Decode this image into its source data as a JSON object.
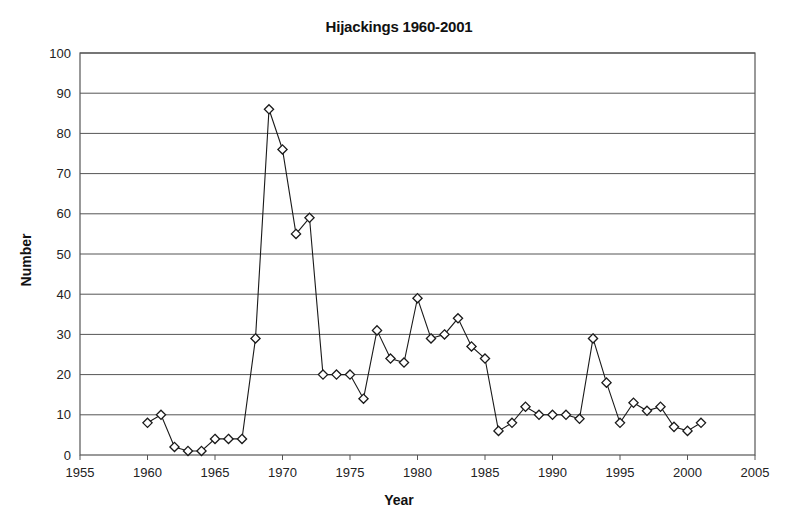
{
  "chart_data": {
    "type": "line",
    "title": "Hijackings 1960-2001",
    "xlabel": "Year",
    "ylabel": "Number",
    "xlim": [
      1955,
      2005
    ],
    "ylim": [
      0,
      100
    ],
    "xticks": [
      1955,
      1960,
      1965,
      1970,
      1975,
      1980,
      1985,
      1990,
      1995,
      2000,
      2005
    ],
    "yticks": [
      0,
      10,
      20,
      30,
      40,
      50,
      60,
      70,
      80,
      90,
      100
    ],
    "grid": "horizontal",
    "legend": null,
    "marker": "open-diamond",
    "line_color": "#1a1a1a",
    "marker_color": "#1a1a1a",
    "marker_fill": "#ffffff",
    "x": [
      1960,
      1961,
      1962,
      1963,
      1964,
      1965,
      1966,
      1967,
      1968,
      1969,
      1970,
      1971,
      1972,
      1973,
      1974,
      1975,
      1976,
      1977,
      1978,
      1979,
      1980,
      1981,
      1982,
      1983,
      1984,
      1985,
      1986,
      1987,
      1988,
      1989,
      1990,
      1991,
      1992,
      1993,
      1994,
      1995,
      1996,
      1997,
      1998,
      1999,
      2000,
      2001
    ],
    "values": [
      8,
      10,
      2,
      1,
      1,
      4,
      4,
      4,
      29,
      86,
      76,
      55,
      59,
      20,
      20,
      20,
      14,
      31,
      24,
      23,
      39,
      29,
      30,
      34,
      27,
      24,
      6,
      8,
      12,
      10,
      10,
      10,
      9,
      29,
      18,
      8,
      13,
      11,
      12,
      7,
      6,
      8
    ],
    "series": [
      {
        "name": "Hijackings",
        "values": [
          8,
          10,
          2,
          1,
          1,
          4,
          4,
          4,
          29,
          86,
          76,
          55,
          59,
          20,
          20,
          20,
          14,
          31,
          24,
          23,
          39,
          29,
          30,
          34,
          27,
          24,
          6,
          8,
          12,
          10,
          10,
          10,
          9,
          29,
          18,
          8,
          13,
          11,
          12,
          7,
          6,
          8
        ]
      }
    ]
  }
}
